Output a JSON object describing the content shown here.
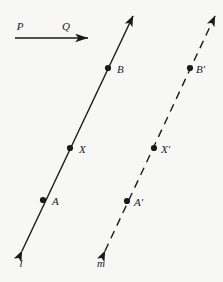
{
  "figure": {
    "background_color": "#f7f7f5",
    "ink_color": "#1a1a1a",
    "width": 223,
    "height": 282
  },
  "chart_data": {
    "type": "scatter",
    "title": "",
    "xlabel": "",
    "ylabel": "",
    "grid": false,
    "legend": null,
    "xlim": [
      0,
      223
    ],
    "ylim": [
      282,
      0
    ],
    "series": [
      {
        "name": "line l points",
        "x": [
          43,
          70,
          108
        ],
        "y": [
          200,
          148,
          68
        ],
        "labels": [
          "A",
          "X",
          "B"
        ]
      },
      {
        "name": "line m points",
        "x": [
          127,
          154,
          190
        ],
        "y": [
          201,
          148,
          68
        ],
        "labels": [
          "A'",
          "X'",
          "B'"
        ]
      }
    ]
  },
  "lines": [
    {
      "id": "line-l",
      "label": "l",
      "style": "solid",
      "stroke_width": 1.4,
      "x1": 22,
      "y1": 251,
      "x2": 133,
      "y2": 16,
      "arrow_start": true,
      "arrow_end": true,
      "label_x": 21,
      "label_y": 267
    },
    {
      "id": "line-m",
      "label": "m",
      "style": "dashed",
      "dash_pattern": "8 6",
      "stroke_width": 1.4,
      "x1": 105,
      "y1": 251,
      "x2": 215,
      "y2": 16,
      "arrow_start": true,
      "arrow_end": true,
      "label_x": 101,
      "label_y": 267
    }
  ],
  "points": [
    {
      "id": "point-A",
      "label": "A",
      "cx": 43,
      "cy": 200,
      "r": 3.1,
      "label_x": 52,
      "label_y": 205,
      "on_line": "line-l"
    },
    {
      "id": "point-X",
      "label": "X",
      "cx": 70,
      "cy": 148,
      "r": 3.1,
      "label_x": 79,
      "label_y": 153,
      "on_line": "line-l"
    },
    {
      "id": "point-B",
      "label": "B",
      "cx": 108,
      "cy": 68,
      "r": 3.1,
      "label_x": 117,
      "label_y": 73,
      "on_line": "line-l"
    },
    {
      "id": "point-A-prime",
      "label": "A′",
      "cx": 127,
      "cy": 201,
      "r": 3.1,
      "label_x": 134,
      "label_y": 206,
      "on_line": "line-m"
    },
    {
      "id": "point-X-prime",
      "label": "X′",
      "cx": 154,
      "cy": 148,
      "r": 3.1,
      "label_x": 161,
      "label_y": 153,
      "on_line": "line-m"
    },
    {
      "id": "point-B-prime",
      "label": "B′",
      "cx": 190,
      "cy": 68,
      "r": 3.1,
      "label_x": 196,
      "label_y": 73,
      "on_line": "line-m"
    }
  ],
  "vector": {
    "id": "vector-PQ",
    "from_label": "P",
    "to_label": "Q",
    "x1": 15,
    "y1": 38,
    "x2": 88,
    "y2": 38,
    "stroke_width": 1.5,
    "from_label_x": 20,
    "from_label_y": 30,
    "to_label_x": 66,
    "to_label_y": 30
  }
}
